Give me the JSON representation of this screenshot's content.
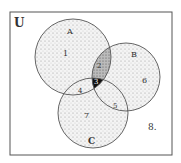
{
  "diagram": {
    "type": "venn",
    "universe_label": "U",
    "sets": [
      {
        "name": "A",
        "label": "A"
      },
      {
        "name": "B",
        "label": "B"
      },
      {
        "name": "C",
        "label": "C"
      }
    ],
    "regions": [
      {
        "id": "1",
        "label": "1",
        "description": "A only"
      },
      {
        "id": "2",
        "label": "2",
        "description": "A and B only"
      },
      {
        "id": "3",
        "label": "3",
        "description": "A and B and C"
      },
      {
        "id": "4",
        "label": "4",
        "description": "A and C only"
      },
      {
        "id": "5",
        "label": "5",
        "description": "B and C only"
      },
      {
        "id": "6",
        "label": "6",
        "description": "B only"
      },
      {
        "id": "7",
        "label": "7",
        "description": "C only"
      },
      {
        "id": "8",
        "label": "8.",
        "description": "outside A, B, C"
      }
    ]
  }
}
